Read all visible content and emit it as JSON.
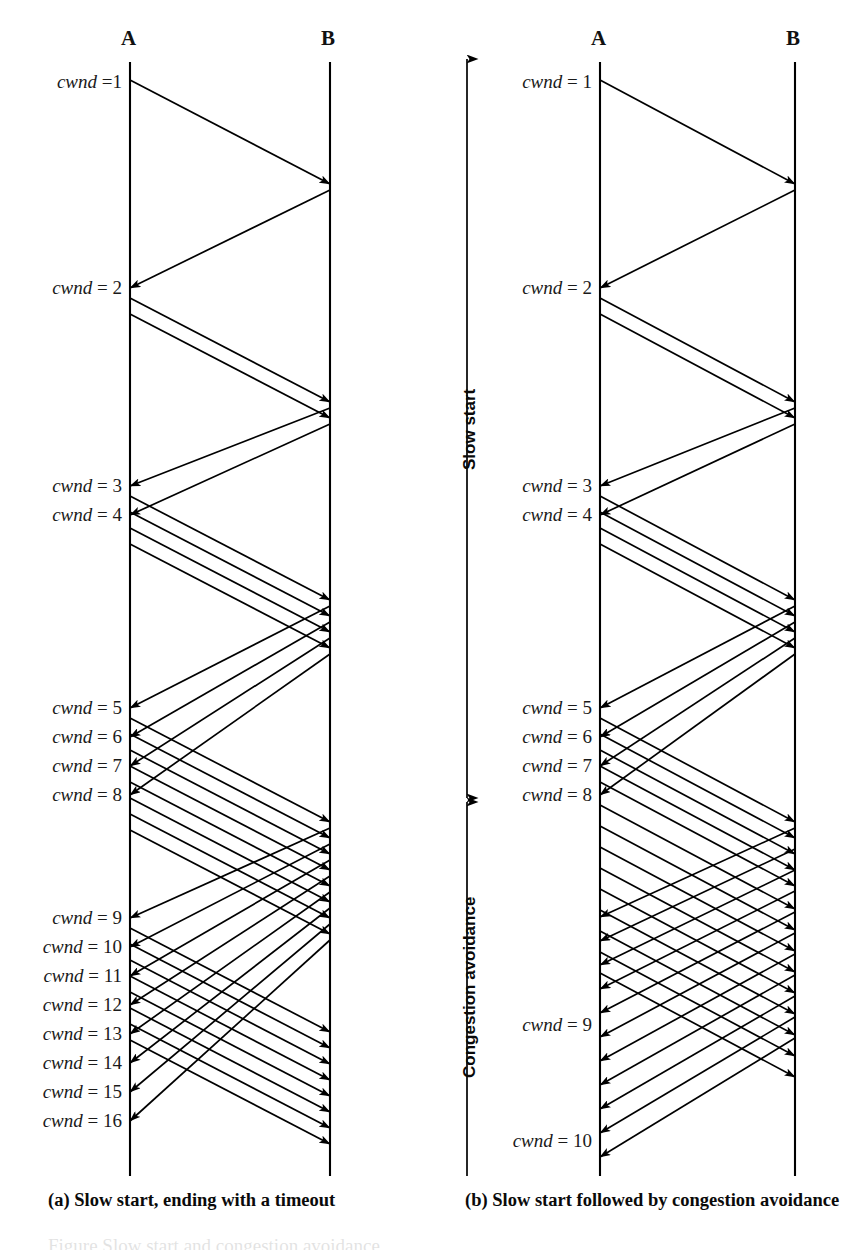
{
  "figure": {
    "width": 851,
    "height": 1252,
    "background": "#ffffff",
    "ink_color": "#000000",
    "clipped_top_text": "a congestion window of one segment",
    "clipped_bottom_text": "Figure Slow start and congestion avoidance"
  },
  "panels": [
    {
      "id": "panel-a",
      "caption": "(a) Slow start, ending with a timeout",
      "caption_x": 48,
      "caption_y": 1205,
      "hosts": [
        {
          "name": "A",
          "x": 130,
          "label_y": 44,
          "line_top": 62,
          "line_bottom": 1176
        },
        {
          "name": "B",
          "x": 330,
          "label_y": 44,
          "line_top": 62,
          "line_bottom": 1176
        }
      ],
      "label_right_edge": 122,
      "cwnd_labels": [
        {
          "text_var": "cwnd",
          "text_eq": "=1",
          "value": 1,
          "y": 86
        },
        {
          "text_var": "cwnd",
          "text_eq": "= 2",
          "value": 2,
          "y": 292
        },
        {
          "text_var": "cwnd",
          "text_eq": "= 3",
          "value": 3,
          "y": 490
        },
        {
          "text_var": "cwnd",
          "text_eq": "= 4",
          "value": 4,
          "y": 519
        },
        {
          "text_var": "cwnd",
          "text_eq": "= 5",
          "value": 5,
          "y": 712
        },
        {
          "text_var": "cwnd",
          "text_eq": "= 6",
          "value": 6,
          "y": 741
        },
        {
          "text_var": "cwnd",
          "text_eq": "= 7",
          "value": 7,
          "y": 770
        },
        {
          "text_var": "cwnd",
          "text_eq": "= 8",
          "value": 8,
          "y": 799
        },
        {
          "text_var": "cwnd",
          "text_eq": "= 9",
          "value": 9,
          "y": 922
        },
        {
          "text_var": "cwnd",
          "text_eq": "= 10",
          "value": 10,
          "y": 951
        },
        {
          "text_var": "cwnd",
          "text_eq": "= 11",
          "value": 11,
          "y": 980
        },
        {
          "text_var": "cwnd",
          "text_eq": "= 12",
          "value": 12,
          "y": 1009
        },
        {
          "text_var": "cwnd",
          "text_eq": "= 13",
          "value": 13,
          "y": 1038
        },
        {
          "text_var": "cwnd",
          "text_eq": "= 14",
          "value": 14,
          "y": 1067
        },
        {
          "text_var": "cwnd",
          "text_eq": "= 15",
          "value": 15,
          "y": 1096
        },
        {
          "text_var": "cwnd",
          "text_eq": "= 16",
          "value": 16,
          "y": 1125
        }
      ],
      "data_segments": [
        {
          "from_y": 80,
          "to_y": 184
        },
        {
          "from_y": 298,
          "to_y": 402
        },
        {
          "from_y": 314,
          "to_y": 418
        },
        {
          "from_y": 496,
          "to_y": 600
        },
        {
          "from_y": 512,
          "to_y": 616
        },
        {
          "from_y": 528,
          "to_y": 632
        },
        {
          "from_y": 544,
          "to_y": 648
        },
        {
          "from_y": 718,
          "to_y": 822
        },
        {
          "from_y": 734,
          "to_y": 838
        },
        {
          "from_y": 750,
          "to_y": 854
        },
        {
          "from_y": 766,
          "to_y": 870
        },
        {
          "from_y": 782,
          "to_y": 886
        },
        {
          "from_y": 798,
          "to_y": 902
        },
        {
          "from_y": 814,
          "to_y": 918
        },
        {
          "from_y": 830,
          "to_y": 934
        },
        {
          "from_y": 928,
          "to_y": 1032
        },
        {
          "from_y": 944,
          "to_y": 1048
        },
        {
          "from_y": 960,
          "to_y": 1064
        },
        {
          "from_y": 976,
          "to_y": 1080
        },
        {
          "from_y": 992,
          "to_y": 1096
        },
        {
          "from_y": 1008,
          "to_y": 1112
        },
        {
          "from_y": 1024,
          "to_y": 1128
        },
        {
          "from_y": 1040,
          "to_y": 1144
        }
      ],
      "ack_segments": [
        {
          "from_y": 190,
          "to_y": 288
        },
        {
          "from_y": 408,
          "to_y": 486
        },
        {
          "from_y": 424,
          "to_y": 515
        },
        {
          "from_y": 606,
          "to_y": 708
        },
        {
          "from_y": 622,
          "to_y": 737
        },
        {
          "from_y": 638,
          "to_y": 766
        },
        {
          "from_y": 654,
          "to_y": 795
        },
        {
          "from_y": 828,
          "to_y": 918
        },
        {
          "from_y": 844,
          "to_y": 947
        },
        {
          "from_y": 860,
          "to_y": 976
        },
        {
          "from_y": 876,
          "to_y": 1005
        },
        {
          "from_y": 892,
          "to_y": 1034
        },
        {
          "from_y": 908,
          "to_y": 1063
        },
        {
          "from_y": 924,
          "to_y": 1092
        },
        {
          "from_y": 940,
          "to_y": 1121
        }
      ]
    },
    {
      "id": "panel-b",
      "caption": "(b) Slow start followed by congestion avoidance",
      "caption_x": 465,
      "caption_y": 1205,
      "hosts": [
        {
          "name": "A",
          "x": 600,
          "label_y": 44,
          "line_top": 62,
          "line_bottom": 1176
        },
        {
          "name": "B",
          "x": 795,
          "label_y": 44,
          "line_top": 62,
          "line_bottom": 1176
        }
      ],
      "label_right_edge": 592,
      "cwnd_labels": [
        {
          "text_var": "cwnd",
          "text_eq": "= 1",
          "value": 1,
          "y": 86
        },
        {
          "text_var": "cwnd",
          "text_eq": "= 2",
          "value": 2,
          "y": 292
        },
        {
          "text_var": "cwnd",
          "text_eq": "= 3",
          "value": 3,
          "y": 490
        },
        {
          "text_var": "cwnd",
          "text_eq": "= 4",
          "value": 4,
          "y": 519
        },
        {
          "text_var": "cwnd",
          "text_eq": "= 5",
          "value": 5,
          "y": 712
        },
        {
          "text_var": "cwnd",
          "text_eq": "= 6",
          "value": 6,
          "y": 741
        },
        {
          "text_var": "cwnd",
          "text_eq": "= 7",
          "value": 7,
          "y": 770
        },
        {
          "text_var": "cwnd",
          "text_eq": "= 8",
          "value": 8,
          "y": 799
        },
        {
          "text_var": "cwnd",
          "text_eq": "= 9",
          "value": 9,
          "y": 1029
        },
        {
          "text_var": "cwnd",
          "text_eq": "= 10",
          "value": 10,
          "y": 1145
        }
      ],
      "data_segments": [
        {
          "from_y": 80,
          "to_y": 184
        },
        {
          "from_y": 298,
          "to_y": 402
        },
        {
          "from_y": 314,
          "to_y": 418
        },
        {
          "from_y": 496,
          "to_y": 600
        },
        {
          "from_y": 512,
          "to_y": 616
        },
        {
          "from_y": 528,
          "to_y": 632
        },
        {
          "from_y": 544,
          "to_y": 648
        },
        {
          "from_y": 718,
          "to_y": 822
        },
        {
          "from_y": 734,
          "to_y": 838
        },
        {
          "from_y": 750,
          "to_y": 854
        },
        {
          "from_y": 766,
          "to_y": 870
        },
        {
          "from_y": 782,
          "to_y": 886
        },
        {
          "from_y": 805,
          "to_y": 909
        },
        {
          "from_y": 826,
          "to_y": 930
        },
        {
          "from_y": 847,
          "to_y": 951
        },
        {
          "from_y": 868,
          "to_y": 972
        },
        {
          "from_y": 889,
          "to_y": 993
        },
        {
          "from_y": 910,
          "to_y": 1014
        },
        {
          "from_y": 931,
          "to_y": 1035
        },
        {
          "from_y": 952,
          "to_y": 1056
        },
        {
          "from_y": 973,
          "to_y": 1077
        }
      ],
      "ack_segments": [
        {
          "from_y": 190,
          "to_y": 288
        },
        {
          "from_y": 408,
          "to_y": 486
        },
        {
          "from_y": 424,
          "to_y": 515
        },
        {
          "from_y": 606,
          "to_y": 708
        },
        {
          "from_y": 622,
          "to_y": 737
        },
        {
          "from_y": 638,
          "to_y": 766
        },
        {
          "from_y": 654,
          "to_y": 795
        },
        {
          "from_y": 828,
          "to_y": 917
        },
        {
          "from_y": 849,
          "to_y": 941
        },
        {
          "from_y": 870,
          "to_y": 965
        },
        {
          "from_y": 891,
          "to_y": 989
        },
        {
          "from_y": 912,
          "to_y": 1013
        },
        {
          "from_y": 933,
          "to_y": 1037
        },
        {
          "from_y": 954,
          "to_y": 1061
        },
        {
          "from_y": 975,
          "to_y": 1085
        },
        {
          "from_y": 996,
          "to_y": 1109
        },
        {
          "from_y": 1017,
          "to_y": 1133
        },
        {
          "from_y": 1038,
          "to_y": 1157
        }
      ]
    }
  ],
  "phase_axis": {
    "x": 467,
    "top": 58,
    "bottom": 1176,
    "divider_y": 800,
    "phases": [
      {
        "label": "Slow start",
        "label_x": 461,
        "label_y": 470
      },
      {
        "label": "Congestion avoidance",
        "label_x": 461,
        "label_y": 1078
      }
    ]
  }
}
